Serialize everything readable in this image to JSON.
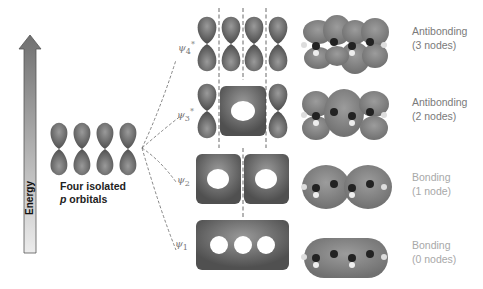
{
  "axis": {
    "label": "Energy",
    "direction": "up"
  },
  "isolated": {
    "line1": "Four isolated",
    "line2_italic": "p",
    "line2_rest": " orbitals"
  },
  "orbitals": [
    {
      "id": "psi4",
      "symbol": "ψ",
      "index": "4",
      "star": "*",
      "type": "Antibonding",
      "nodes": "(3 nodes)"
    },
    {
      "id": "psi3",
      "symbol": "ψ",
      "index": "3",
      "star": "*",
      "type": "Antibonding",
      "nodes": "(2 nodes)"
    },
    {
      "id": "psi2",
      "symbol": "ψ",
      "index": "2",
      "star": "",
      "type": "Bonding",
      "nodes": "(1 node)"
    },
    {
      "id": "psi1",
      "symbol": "ψ",
      "index": "1",
      "star": "",
      "type": "Bonding",
      "nodes": "(0 nodes)"
    }
  ],
  "colors": {
    "lobe": "#7d7d7d",
    "lobe_dark": "#4a4a4a",
    "surface": "#8a8a8a",
    "arrow_top": "#707070",
    "arrow_bottom": "#e6e6e6"
  }
}
